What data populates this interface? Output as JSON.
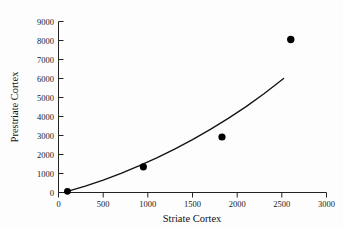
{
  "chart_data": {
    "type": "scatter",
    "title": "",
    "subtitle": "",
    "xlabel": "Striate Cortex",
    "ylabel": "Prestriate Cortex",
    "xlim": [
      0,
      3000
    ],
    "ylim": [
      0,
      9000
    ],
    "xticks": [
      0,
      500,
      1000,
      1500,
      2000,
      2500,
      3000
    ],
    "yticks": [
      0,
      1000,
      2000,
      3000,
      4000,
      5000,
      6000,
      7000,
      8000,
      9000
    ],
    "xtick_labels": [
      "0",
      "500",
      "1000",
      "1500",
      "2000",
      "2500",
      "3000"
    ],
    "ytick_labels": [
      "0",
      "1000",
      "2000",
      "3000",
      "4000",
      "5000",
      "6000",
      "7000",
      "8000",
      "9000"
    ],
    "grid": false,
    "legend": false,
    "legend_position": "none",
    "marker": "filled-circle",
    "marker_color": "#000000",
    "curve_color": "#111111",
    "background_color": "#fdfdfd",
    "series": [
      {
        "name": "observations",
        "type": "scatter",
        "x": [
          100,
          950,
          1830,
          2600
        ],
        "y": [
          60,
          1350,
          2920,
          8050
        ]
      },
      {
        "name": "fitted-curve",
        "type": "line",
        "x": [
          100,
          300,
          500,
          700,
          900,
          1100,
          1300,
          1500,
          1700,
          1900,
          2100,
          2300,
          2520
        ],
        "y": [
          60,
          330,
          650,
          1010,
          1400,
          1820,
          2280,
          2780,
          3320,
          3900,
          4520,
          5200,
          6000
        ]
      }
    ]
  }
}
